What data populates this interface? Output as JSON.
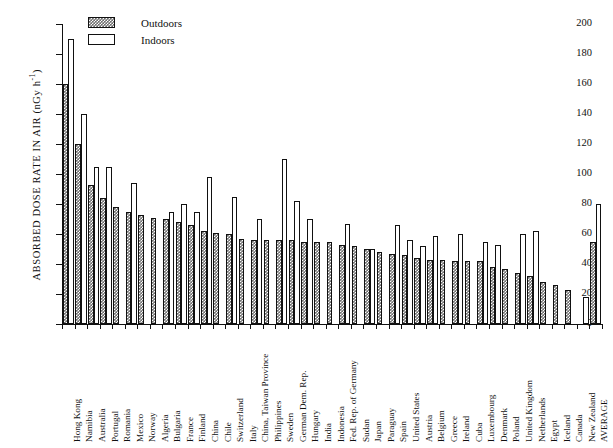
{
  "chart_data": {
    "type": "bar",
    "title": "",
    "xlabel": "",
    "ylabel": "ABSORBED DOSE RATE IN AIR (nGy h",
    "ylabel_sup": "-1",
    "ylabel_close": ")",
    "ylim": [
      0,
      200
    ],
    "yticks": [
      0,
      20,
      40,
      60,
      80,
      100,
      120,
      140,
      160,
      180,
      200
    ],
    "grid": false,
    "legend_position": "top-left",
    "categories": [
      "Hong Kong",
      "Namibia",
      "Australia",
      "Portugal",
      "Romania",
      "Mexico",
      "Norway",
      "Algeria",
      "Bulgaria",
      "France",
      "Finland",
      "China",
      "Chile",
      "Switzerland",
      "Italy",
      "China, Taiwan Province",
      "Philippines",
      "Sweden",
      "German Dem. Rep.",
      "Hungary",
      "India",
      "Indonesia",
      "Fed. Rep. of Germany",
      "Sudan",
      "Japan",
      "Paraguay",
      "Spain",
      "United States",
      "Austria",
      "Belgium",
      "Greece",
      "Ireland",
      "Cuba",
      "Luxembourg",
      "Denmark",
      "Poland",
      "United Kingdom",
      "Netherlands",
      "Egypt",
      "Iceland",
      "Canada",
      "New Zealand",
      "AVERAGE"
    ],
    "series": [
      {
        "name": "Outdoors",
        "values": [
          160,
          120,
          93,
          84,
          78,
          75,
          73,
          71,
          70,
          68,
          66,
          62,
          61,
          60,
          57,
          56,
          56,
          56,
          56,
          55,
          55,
          55,
          53,
          52,
          50,
          48,
          47,
          46,
          44,
          43,
          43,
          42,
          42,
          42,
          38,
          37,
          34,
          32,
          28,
          26,
          23,
          null,
          55
        ]
      },
      {
        "name": "Indoors",
        "values": [
          190,
          140,
          105,
          105,
          null,
          94,
          null,
          null,
          75,
          80,
          75,
          98,
          null,
          85,
          null,
          70,
          null,
          110,
          82,
          70,
          null,
          null,
          67,
          null,
          50,
          null,
          66,
          56,
          52,
          59,
          null,
          60,
          null,
          55,
          53,
          null,
          60,
          62,
          null,
          null,
          null,
          18,
          80
        ]
      }
    ]
  },
  "legend": {
    "items": [
      {
        "label": "Outdoors",
        "swatch": "hatched"
      },
      {
        "label": "Indoors",
        "swatch": "white"
      }
    ]
  },
  "caption": ""
}
